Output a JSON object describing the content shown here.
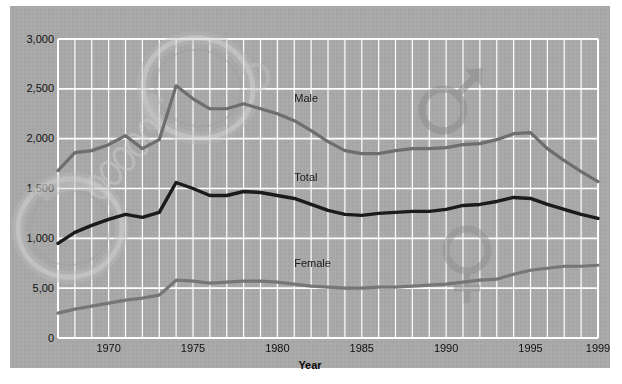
{
  "figure": {
    "background_color": "#a9a9a9",
    "frame_color": "#ffffff",
    "grid_color": "#ffffff"
  },
  "chart_data": {
    "type": "line",
    "title": "",
    "subtitle": "",
    "xlabel": "Year",
    "ylabel": "",
    "xlim": [
      1967,
      1999
    ],
    "ylim": [
      0,
      3000
    ],
    "grid": true,
    "grid_orientation": "both",
    "legend": "inline-annotations",
    "ytick_labels": [
      "0",
      "5,00",
      "1,000",
      "1,500",
      "2,000",
      "2,500",
      "3,000"
    ],
    "ytick_values": [
      0,
      500,
      1000,
      1500,
      2000,
      2500,
      3000
    ],
    "xtick_labels": [
      "1970",
      "1975",
      "1980",
      "1985",
      "1990",
      "1995",
      "1999"
    ],
    "xtick_values": [
      1970,
      1975,
      1980,
      1985,
      1990,
      1995,
      1999
    ],
    "x": [
      1967,
      1968,
      1969,
      1970,
      1971,
      1972,
      1973,
      1974,
      1975,
      1976,
      1977,
      1978,
      1979,
      1980,
      1981,
      1982,
      1983,
      1984,
      1985,
      1986,
      1987,
      1988,
      1989,
      1990,
      1991,
      1992,
      1993,
      1994,
      1995,
      1996,
      1997,
      1998,
      1999
    ],
    "series": [
      {
        "name": "Male",
        "color": "#6e6e6e",
        "annotation": "Male",
        "values": [
          1680,
          1860,
          1880,
          1940,
          2030,
          1900,
          1990,
          2530,
          2400,
          2300,
          2300,
          2350,
          2300,
          2250,
          2180,
          2080,
          1970,
          1880,
          1850,
          1850,
          1880,
          1900,
          1900,
          1910,
          1940,
          1950,
          1990,
          2050,
          2060,
          1900,
          1780,
          1670,
          1570
        ]
      },
      {
        "name": "Total",
        "color": "#1b1b1b",
        "annotation": "Total",
        "values": [
          950,
          1060,
          1130,
          1190,
          1240,
          1210,
          1260,
          1560,
          1500,
          1430,
          1430,
          1470,
          1460,
          1430,
          1400,
          1340,
          1280,
          1240,
          1230,
          1250,
          1260,
          1270,
          1270,
          1290,
          1330,
          1340,
          1370,
          1410,
          1400,
          1340,
          1290,
          1240,
          1200
        ]
      },
      {
        "name": "Female",
        "color": "#767676",
        "annotation": "Female",
        "values": [
          250,
          290,
          320,
          350,
          380,
          400,
          430,
          580,
          570,
          550,
          560,
          570,
          570,
          560,
          540,
          520,
          510,
          500,
          500,
          510,
          510,
          520,
          530,
          540,
          560,
          580,
          590,
          640,
          680,
          700,
          720,
          720,
          730
        ]
      }
    ],
    "watermarks": [
      {
        "name": "handcuffs-watermark",
        "description": "Handcuffs with chain"
      },
      {
        "name": "mars-symbol-watermark",
        "description": "Male (Mars) gender symbol"
      },
      {
        "name": "venus-symbol-watermark",
        "description": "Female (Venus) gender symbol"
      }
    ]
  }
}
